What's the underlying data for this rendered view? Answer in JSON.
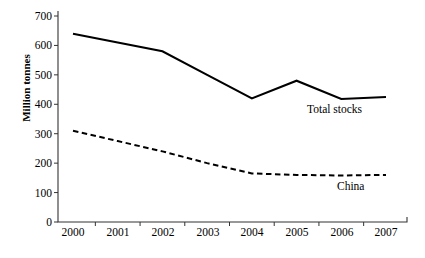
{
  "chart_data": {
    "type": "line",
    "title": "",
    "subtitle": "",
    "xlabel": "",
    "ylabel": "Million tonnes",
    "x": [
      2000,
      2001,
      2002,
      2003,
      2004,
      2005,
      2006,
      2007
    ],
    "xticklabels": [
      "2000",
      "2001",
      "2002",
      "2003",
      "2004",
      "2005",
      "2006",
      "2007"
    ],
    "yticklabels": [
      "0",
      "100",
      "200",
      "300",
      "400",
      "500",
      "600",
      "700"
    ],
    "yticks": [
      0,
      100,
      200,
      300,
      400,
      500,
      600,
      700
    ],
    "ylim": [
      0,
      700
    ],
    "grid": false,
    "legend_position": "inline-annotations",
    "series": [
      {
        "name": "Total stocks",
        "style": "solid",
        "color": "#000000",
        "values": [
          640,
          610,
          580,
          500,
          420,
          480,
          418,
          425
        ],
        "annotation": "Total stocks"
      },
      {
        "name": "China",
        "style": "dashed",
        "color": "#000000",
        "values": [
          310,
          275,
          240,
          200,
          165,
          160,
          158,
          160
        ],
        "annotation": "China"
      }
    ]
  },
  "axes": {
    "axis_color": "#333333",
    "background": "#ffffff"
  }
}
